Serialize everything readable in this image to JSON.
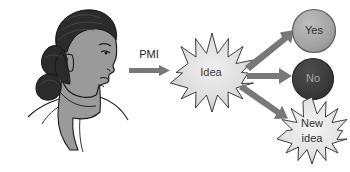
{
  "figure": {
    "background_color": "#ffffff"
  },
  "source_node": {
    "name": "person-illustration",
    "description": "Line-drawn profile portrait of a person with dark hair in a bun, facing right",
    "hair_color": "#2b2b2b",
    "skin_color": "#9a9a9a",
    "outline_color": "#1a1a1a"
  },
  "process_arrow": {
    "label": "PMI",
    "color": "#787878"
  },
  "idea_node": {
    "label": "Idea",
    "shape": "starburst",
    "fill_color": "#dcdcdc",
    "outline_color": "#2a2a2a",
    "text_color": "#3d3d3d"
  },
  "outcomes": [
    {
      "label": "Yes",
      "shape": "circle",
      "fill_color": "#a5a5a5",
      "outline_color": "#5a5a5a",
      "text_color": "#2f2f2f",
      "arrow_color": "#787878",
      "arrow_direction": "up-right"
    },
    {
      "label": "No",
      "shape": "circle",
      "fill_color": "#3a3a3a",
      "outline_color": "#2a2a2a",
      "text_color": "#a8a8a8",
      "arrow_color": "#787878",
      "arrow_direction": "right"
    },
    {
      "label_line1": "New",
      "label_line2": "idea",
      "label": "New idea",
      "shape": "starburst",
      "fill_color": "#e2e2e2",
      "outline_color": "#2a2a2a",
      "text_color": "#2f2f2f",
      "arrow_color": "#787878",
      "arrow_direction": "down-right"
    }
  ]
}
